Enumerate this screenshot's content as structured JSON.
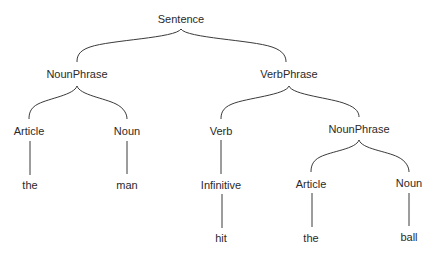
{
  "diagram": {
    "type": "parse-tree",
    "nodes": [
      {
        "id": "sentence",
        "label": "Sentence",
        "x": 181,
        "y": 19
      },
      {
        "id": "np1",
        "label": "NounPhrase",
        "x": 77,
        "y": 74
      },
      {
        "id": "vp",
        "label": "VerbPhrase",
        "x": 289,
        "y": 74
      },
      {
        "id": "art1",
        "label": "Article",
        "x": 29,
        "y": 131
      },
      {
        "id": "noun1",
        "label": "Noun",
        "x": 127,
        "y": 131
      },
      {
        "id": "verb",
        "label": "Verb",
        "x": 221,
        "y": 131
      },
      {
        "id": "np2",
        "label": "NounPhrase",
        "x": 359,
        "y": 129
      },
      {
        "id": "the1",
        "label": "the",
        "x": 30,
        "y": 185
      },
      {
        "id": "man",
        "label": "man",
        "x": 127,
        "y": 185
      },
      {
        "id": "inf",
        "label": "Infinitive",
        "x": 221,
        "y": 185
      },
      {
        "id": "art2",
        "label": "Article",
        "x": 311,
        "y": 184
      },
      {
        "id": "noun2",
        "label": "Noun",
        "x": 409,
        "y": 183
      },
      {
        "id": "hit",
        "label": "hit",
        "x": 221,
        "y": 238
      },
      {
        "id": "the2",
        "label": "the",
        "x": 311,
        "y": 238
      },
      {
        "id": "ball",
        "label": "ball",
        "x": 409,
        "y": 237
      }
    ],
    "edges": [
      {
        "from": "sentence",
        "to": "np1"
      },
      {
        "from": "sentence",
        "to": "vp"
      },
      {
        "from": "np1",
        "to": "art1"
      },
      {
        "from": "np1",
        "to": "noun1"
      },
      {
        "from": "vp",
        "to": "verb"
      },
      {
        "from": "vp",
        "to": "np2"
      },
      {
        "from": "art1",
        "to": "the1"
      },
      {
        "from": "noun1",
        "to": "man"
      },
      {
        "from": "verb",
        "to": "inf"
      },
      {
        "from": "inf",
        "to": "hit"
      },
      {
        "from": "np2",
        "to": "art2"
      },
      {
        "from": "np2",
        "to": "noun2"
      },
      {
        "from": "art2",
        "to": "the2"
      },
      {
        "from": "noun2",
        "to": "ball"
      }
    ],
    "colors": {
      "line": "#3a3a3a",
      "text": "#2a2a2a",
      "background": "#ffffff"
    }
  }
}
